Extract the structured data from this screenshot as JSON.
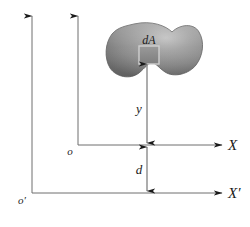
{
  "figure": {
    "kind": "engineering-diagram",
    "labels": {
      "differential_area": "dA",
      "distance_y": "y",
      "distance_d": "d",
      "axis_x": "X",
      "axis_x_prime": "X′",
      "origin_o": "o",
      "origin_o_prime": "o′"
    },
    "colors": {
      "line": "#6e6e6e",
      "arrowhead": "#1a1a1a",
      "text": "#1a1a1a",
      "blob_edge": "#6b6b6b",
      "blob_mid": "#8e8e8e",
      "blob_light": "#b9b9b9",
      "element_fill": "#8a8a8a",
      "element_border": "#c8c8c8",
      "background": "#ffffff"
    },
    "geometry": {
      "axis_x_y": 145,
      "axis_x_prime_y": 193,
      "vertical_o_x": 78,
      "vertical_o_prime_x": 32,
      "measure_line_x": 147,
      "blob_left": 108,
      "blob_right": 201,
      "blob_top": 24,
      "blob_bottom": 79,
      "element_x": 139,
      "element_y": 46,
      "element_size": 20
    }
  }
}
